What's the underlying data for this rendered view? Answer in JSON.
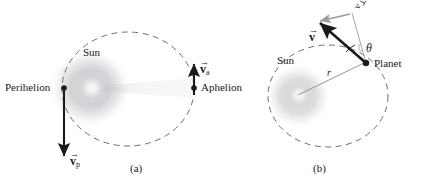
{
  "figure": {
    "type": "physics-diagram",
    "width": 425,
    "height": 188,
    "background": "#ffffff"
  },
  "colors": {
    "ink": "#1a1a1a",
    "orbit_dash": "#6e6e72",
    "sun_core": "#e8e8ea",
    "sun_mid": "#c9c9ce",
    "sun_outer": "#a8a8ae",
    "gray_vector": "#9a9aa0",
    "radius_line": "#8a8a90"
  },
  "panel_a": {
    "caption": "(a)",
    "sun_label": "Sun",
    "perihelion_label": "Perihelion",
    "aphelion_label": "Aphelion",
    "velocity_perihelion": {
      "symbol": "v",
      "subscript": "p",
      "accent": "vector-arrow",
      "direction": "down",
      "magnitude_relative": "large"
    },
    "velocity_aphelion": {
      "symbol": "v",
      "subscript": "a",
      "accent": "vector-arrow",
      "direction": "up",
      "magnitude_relative": "small"
    },
    "orbit": {
      "shape": "ellipse",
      "style": "dashed",
      "center_x": 128,
      "center_y": 89,
      "rx": 66,
      "ry": 57
    },
    "sun_position": {
      "x": 90,
      "y": 88
    },
    "perihelion_point": {
      "x": 64,
      "y": 88
    },
    "aphelion_point": {
      "x": 194,
      "y": 88
    }
  },
  "panel_b": {
    "caption": "(b)",
    "sun_label": "Sun",
    "planet_label": "Planet",
    "radius_label": "r",
    "angle_label": "θ",
    "velocity": {
      "symbol": "v",
      "accent": "vector-arrow",
      "description": "total velocity vector of planet"
    },
    "velocity_perpendicular": {
      "symbol": "v",
      "subscript": "⊥",
      "description": "component of velocity perpendicular to radius"
    },
    "orbit": {
      "shape": "ellipse",
      "style": "dashed",
      "center_x": 328,
      "center_y": 96,
      "rx": 60,
      "ry": 51
    },
    "sun_position": {
      "x": 298,
      "y": 96
    },
    "planet_position": {
      "x": 366,
      "y": 63
    }
  }
}
